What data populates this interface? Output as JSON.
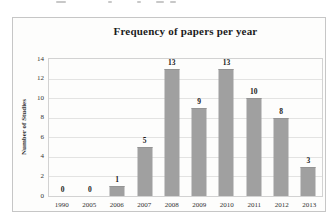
{
  "chart": {
    "title": "Frequency of papers per year",
    "ylabel": "Number of Studies"
  },
  "chart_data": {
    "type": "bar",
    "title": "Frequency of papers per year",
    "xlabel": "",
    "ylabel": "Number of Studies",
    "categories": [
      "1990",
      "2005",
      "2006",
      "2007",
      "2008",
      "2009",
      "2010",
      "2011",
      "2012",
      "2013"
    ],
    "values": [
      0,
      0,
      1,
      5,
      13,
      9,
      13,
      10,
      8,
      3
    ],
    "ylim": [
      0,
      14
    ],
    "yticks": [
      0,
      2,
      4,
      6,
      8,
      10,
      12,
      14
    ],
    "grid": "horizontal",
    "legend": "none",
    "bar_color": "#a0a0a0",
    "value_labels_shown": true
  },
  "colors": {
    "bar": "#a0a0a0",
    "gridline": "#e3e3e2",
    "plot_border": "#d2d2d2",
    "frame_border": "#c6c6c6",
    "background": "#fdfdfc",
    "text": "#1c1c1c"
  }
}
